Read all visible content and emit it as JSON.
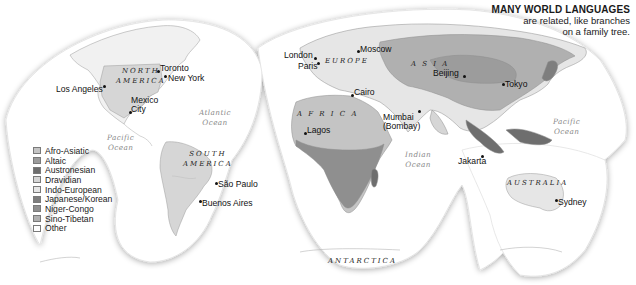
{
  "title": {
    "heading": "MANY WORLD LANGUAGES",
    "subtitle_line1": "are related, like branches",
    "subtitle_line2": "on a family tree."
  },
  "legend": {
    "items": [
      {
        "label": "Afro-Asiatic",
        "color": "#c4c4c4"
      },
      {
        "label": "Altaic",
        "color": "#9c9c9c"
      },
      {
        "label": "Austronesian",
        "color": "#6e6e6e"
      },
      {
        "label": "Dravidian",
        "color": "#d6d6d6"
      },
      {
        "label": "Indo-European",
        "color": "#e6e6e6"
      },
      {
        "label": "Japanese/Korean",
        "color": "#7e7e7e"
      },
      {
        "label": "Niger-Congo",
        "color": "#8f8f8f"
      },
      {
        "label": "Sino-Tibetan",
        "color": "#b0b0b0"
      },
      {
        "label": "Other",
        "color": "#ffffff"
      }
    ]
  },
  "continents": {
    "north_america_1": "NORTH",
    "north_america_2": "AMERICA",
    "south_america_1": "SOUTH",
    "south_america_2": "AMERICA",
    "europe": "EUROPE",
    "asia": "A S I A",
    "africa": "A F R I C A",
    "australia": "AUSTRALIA",
    "antarctica": "ANTARCTICA"
  },
  "oceans": {
    "atlantic_1": "Atlantic",
    "atlantic_2": "Ocean",
    "pacific_west_1": "Pacific",
    "pacific_west_2": "Ocean",
    "indian_1": "Indian",
    "indian_2": "Ocean",
    "pacific_east_1": "Pacific",
    "pacific_east_2": "Ocean"
  },
  "cities": {
    "toronto": "Toronto",
    "new_york": "New York",
    "los_angeles": "Los Angeles",
    "mexico_city_1": "Mexico",
    "mexico_city_2": "City",
    "sao_paulo": "São Paulo",
    "buenos_aires": "Buenos Aires",
    "london": "London",
    "paris": "Paris",
    "moscow": "Moscow",
    "cairo": "Cairo",
    "lagos": "Lagos",
    "mumbai_1": "Mumbai",
    "mumbai_2": "(Bombay)",
    "beijing": "Beijing",
    "tokyo": "Tokyo",
    "jakarta": "Jakarta",
    "sydney": "Sydney"
  }
}
